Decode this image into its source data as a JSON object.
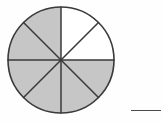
{
  "figure": {
    "type": "fraction-circle-diagram",
    "shape": "circle",
    "total_sectors": 8,
    "shaded_sectors": 6,
    "unshaded_sectors": 2,
    "fraction_shaded": "6/8",
    "center_x": 61,
    "center_y": 60,
    "radius": 53,
    "sector_angle_degrees": 45,
    "start_angle_degrees": -90,
    "sectors": [
      {
        "index": 0,
        "from_deg": -90,
        "to_deg": -45,
        "shaded": false,
        "label": "sector-1"
      },
      {
        "index": 1,
        "from_deg": -45,
        "to_deg": 0,
        "shaded": false,
        "label": "sector-2"
      },
      {
        "index": 2,
        "from_deg": 0,
        "to_deg": 45,
        "shaded": true,
        "label": "sector-3"
      },
      {
        "index": 3,
        "from_deg": 45,
        "to_deg": 90,
        "shaded": true,
        "label": "sector-4"
      },
      {
        "index": 4,
        "from_deg": 90,
        "to_deg": 135,
        "shaded": true,
        "label": "sector-5"
      },
      {
        "index": 5,
        "from_deg": 135,
        "to_deg": 180,
        "shaded": true,
        "label": "sector-6"
      },
      {
        "index": 6,
        "from_deg": 180,
        "to_deg": 225,
        "shaded": true,
        "label": "sector-7"
      },
      {
        "index": 7,
        "from_deg": 225,
        "to_deg": 270,
        "shaded": true,
        "label": "sector-8"
      }
    ],
    "colors": {
      "shaded_fill": "#c6c6c6",
      "unshaded_fill": "#ffffff",
      "outline": "#3a3a3a",
      "spoke": "#3a3a3a",
      "background": "#fefefe",
      "answer_line": "#4a4a4a"
    },
    "outline_width": 1.6,
    "spoke_width": 1.5
  },
  "answer_blank": {
    "present": true,
    "value": "",
    "x": 131,
    "y": 110,
    "width": 30
  }
}
